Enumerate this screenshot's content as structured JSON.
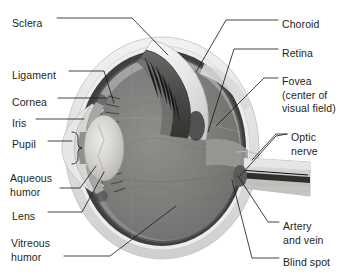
{
  "figure": {
    "background_color": "#ffffff",
    "text_color": "#231f20",
    "leader_line_color": "#231f20"
  },
  "labels_left": [
    {
      "id": "sclera",
      "text": "Sclera",
      "x": 12,
      "y": 17
    },
    {
      "id": "ligament",
      "text": "Ligament",
      "x": 12,
      "y": 69
    },
    {
      "id": "cornea",
      "text": "Cornea",
      "x": 12,
      "y": 96
    },
    {
      "id": "iris",
      "text": "Iris",
      "x": 12,
      "y": 117
    },
    {
      "id": "pupil",
      "text": "Pupil",
      "x": 12,
      "y": 138
    },
    {
      "id": "aqueous-humor",
      "text": "Aqueous\nhumor",
      "x": 10,
      "y": 172
    },
    {
      "id": "lens",
      "text": "Lens",
      "x": 12,
      "y": 210
    },
    {
      "id": "vitreous-humor",
      "text": "Vitreous\nhumor",
      "x": 11,
      "y": 237
    }
  ],
  "labels_right": [
    {
      "id": "choroid",
      "text": "Choroid",
      "x": 282,
      "y": 18
    },
    {
      "id": "retina",
      "text": "Retina",
      "x": 282,
      "y": 47
    },
    {
      "id": "fovea",
      "text": "Fovea\n(center of\nvisual field)",
      "x": 282,
      "y": 75
    },
    {
      "id": "optic-nerve",
      "text": "Optic\nnerve",
      "x": 291,
      "y": 131
    },
    {
      "id": "artery-vein",
      "text": "Artery\nand vein",
      "x": 283,
      "y": 220
    },
    {
      "id": "blind-spot",
      "text": "Blind spot",
      "x": 283,
      "y": 256
    }
  ],
  "structures": [
    {
      "id": "sclera",
      "name": "Sclera",
      "fill": "#e3e3e3"
    },
    {
      "id": "choroid",
      "name": "Choroid",
      "fill": "#4f4f4f"
    },
    {
      "id": "retina",
      "name": "Retina",
      "fill": "#8e8e8e"
    },
    {
      "id": "vitreous-humor",
      "name": "Vitreous humor",
      "fill": "#7f7f7f"
    },
    {
      "id": "lens",
      "name": "Lens",
      "fill": "#d0cfcd"
    },
    {
      "id": "cornea",
      "name": "Cornea",
      "fill": "#dededc"
    },
    {
      "id": "iris",
      "name": "Iris",
      "fill": "#b9b9b7"
    },
    {
      "id": "pupil",
      "name": "Pupil",
      "fill": "#9c9c9a"
    },
    {
      "id": "aqueous-humor",
      "name": "Aqueous humor",
      "fill": "#cfcfcd"
    },
    {
      "id": "optic-nerve",
      "name": "Optic nerve",
      "fill": "#c9c9c7"
    },
    {
      "id": "artery-vein",
      "name": "Artery and vein",
      "fill": "#3a3a3a"
    },
    {
      "id": "fovea",
      "name": "Fovea",
      "fill": "#4a4a4a"
    },
    {
      "id": "ciliary-body",
      "name": "Ciliary body / ligament",
      "fill": "#6b6b69"
    }
  ]
}
